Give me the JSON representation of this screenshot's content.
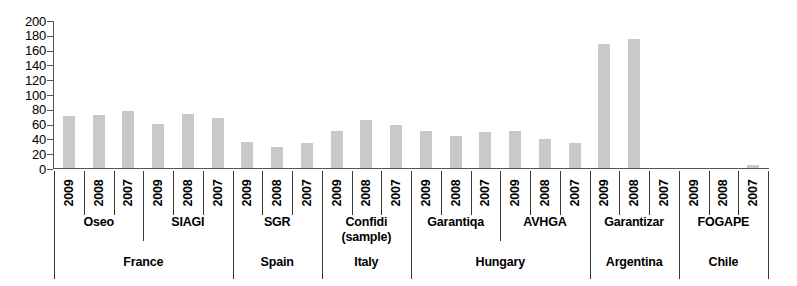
{
  "chart_data": {
    "type": "bar",
    "title": "",
    "subtitle": "",
    "xlabel": "",
    "ylabel": "",
    "ylim": [
      0,
      200
    ],
    "ytick_step": 20,
    "yticks": [
      200,
      180,
      160,
      140,
      120,
      100,
      80,
      60,
      40,
      20,
      0
    ],
    "grid": false,
    "legend": "none",
    "bar_color": "#c9c9c9",
    "axis_color": "#555555",
    "categories": [
      "Oseo 2009",
      "Oseo 2008",
      "Oseo 2007",
      "SIAGI 2009",
      "SIAGI 2008",
      "SIAGI 2007",
      "SGR 2009",
      "SGR 2008",
      "SGR 2007",
      "Confidi (sample) 2009",
      "Confidi (sample) 2008",
      "Confidi (sample) 2007",
      "Garantiqa 2009",
      "Garantiqa 2008",
      "Garantiqa 2007",
      "AVHGA 2009",
      "AVHGA 2008",
      "AVHGA 2007",
      "Garantizar 2009",
      "Garantizar 2008",
      "Garantizar 2007",
      "FOGAPE 2009",
      "FOGAPE 2008",
      "FOGAPE 2007"
    ],
    "values": [
      71,
      73,
      79,
      61,
      74,
      69,
      37,
      30,
      35,
      52,
      66,
      60,
      51,
      45,
      50,
      52,
      41,
      35,
      169,
      176,
      0,
      1,
      1,
      6
    ],
    "years": [
      "2009",
      "2008",
      "2007"
    ],
    "institutions": [
      "Oseo",
      "SIAGI",
      "SGR",
      "Confidi\n(sample)",
      "Garantiqa",
      "AVHGA",
      "Garantizar",
      "FOGAPE"
    ],
    "countries": [
      "France",
      "Spain",
      "Italy",
      "Hungary",
      "Argentina",
      "Chile"
    ]
  },
  "axis": {
    "year_row": [
      "2009",
      "2008",
      "2007",
      "2009",
      "2008",
      "2007",
      "2009",
      "2008",
      "2007",
      "2009",
      "2008",
      "2007",
      "2009",
      "2008",
      "2007",
      "2009",
      "2008",
      "2007",
      "2009",
      "2008",
      "2007",
      "2009",
      "2008",
      "2007"
    ],
    "institution_row": [
      {
        "label": "Oseo",
        "label2": "",
        "span": 3
      },
      {
        "label": "SIAGI",
        "label2": "",
        "span": 3
      },
      {
        "label": "SGR",
        "label2": "",
        "span": 3
      },
      {
        "label": "Confidi",
        "label2": "(sample)",
        "span": 3
      },
      {
        "label": "Garantiqa",
        "label2": "",
        "span": 3
      },
      {
        "label": "AVHGA",
        "label2": "",
        "span": 3
      },
      {
        "label": "Garantizar",
        "label2": "",
        "span": 3
      },
      {
        "label": "FOGAPE",
        "label2": "",
        "span": 3
      }
    ],
    "country_row": [
      {
        "label": "France",
        "span": 6
      },
      {
        "label": "Spain",
        "span": 3
      },
      {
        "label": "Italy",
        "span": 3
      },
      {
        "label": "Hungary",
        "span": 6
      },
      {
        "label": "Argentina",
        "span": 3
      },
      {
        "label": "Chile",
        "span": 3
      }
    ]
  }
}
